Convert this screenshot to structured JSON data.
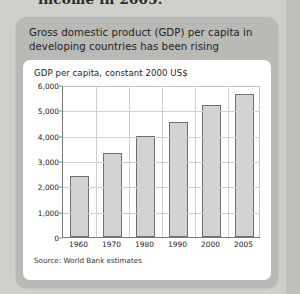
{
  "page": {
    "cut_off_headline": "income in 2005."
  },
  "card": {
    "title": "Gross domestic product (GDP) per capita in developing countries has been rising"
  },
  "chart_data": {
    "type": "bar",
    "title": "Gross domestic product (GDP) per capita in developing countries has been rising",
    "subtitle": "GDP per capita, constant 2000 US$",
    "xlabel": "",
    "ylabel": "GDP per capita, constant 2000 US$",
    "categories": [
      "1960",
      "1970",
      "1980",
      "1990",
      "2000",
      "2005"
    ],
    "values": [
      2400,
      3300,
      3990,
      4550,
      5230,
      5650
    ],
    "ylim": [
      0,
      6000
    ],
    "yticks": [
      0,
      1000,
      2000,
      3000,
      4000,
      5000,
      6000
    ],
    "ytick_labels": [
      "0",
      "1,000",
      "2,000",
      "3,000",
      "4,000",
      "5,000",
      "6,000"
    ],
    "grid": true,
    "legend": false,
    "source": "Source: World Bank estimates",
    "colors": {
      "bar_fill": "#d3d3d3",
      "bar_stroke": "#6e6e6e",
      "grid": "#cfcfcf",
      "axis": "#777777",
      "card_bg": "#b9b9b6",
      "panel_bg": "#ffffff",
      "page_bg": "#cfcfcb"
    }
  }
}
